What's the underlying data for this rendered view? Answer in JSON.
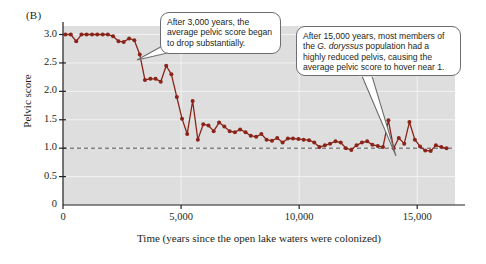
{
  "figure": {
    "panel_label": "(B)",
    "background_color": "#dededf",
    "series_color": "#8a2318",
    "reference_line_value": 1.0
  },
  "callouts": [
    {
      "id": "callout-3000-years",
      "text": "After 3,000 years, the average pelvic score began to drop substantially.",
      "lines": [
        "After 3,000 years, the",
        "average pelvic score began",
        "to drop substantially."
      ]
    },
    {
      "id": "callout-15000-years",
      "text": "After 15,000 years, most members of the G. doryssus population had a highly reduced pelvis, causing the average pelvic score to hover near 1.",
      "lines": [
        "After 15,000 years, most members of",
        "the |G. doryssus| population had a",
        "highly reduced pelvis, causing the",
        "average pelvic score to hover near 1."
      ]
    }
  ],
  "chart_data": {
    "type": "line",
    "title": "",
    "xlabel": "Time (years since the open lake waters were colonized)",
    "ylabel": "Pelvic score",
    "xlim": [
      0,
      16600
    ],
    "ylim": [
      0,
      3.15
    ],
    "xticks": [
      0,
      5000,
      10000,
      15000
    ],
    "xticklabels": [
      "0",
      "5,000",
      "10,000",
      "15,000"
    ],
    "yticks": [
      0,
      0.5,
      1.0,
      1.5,
      2.0,
      2.5,
      3.0
    ],
    "yticklabels": [
      "0",
      "0.5",
      "1.0",
      "1.5",
      "2.0",
      "2.5",
      "3.0"
    ],
    "grid": true,
    "legend": "none",
    "markers": true,
    "reference_lines": [
      {
        "y": 1.0,
        "style": "dashed"
      }
    ],
    "series": [
      {
        "name": "Average pelvic score",
        "color": "#8a2318",
        "x": [
          100,
          330,
          560,
          780,
          1000,
          1230,
          1450,
          1680,
          1900,
          2120,
          2350,
          2570,
          2800,
          3020,
          3250,
          3470,
          3700,
          3920,
          4140,
          4370,
          4590,
          4820,
          5040,
          5260,
          5490,
          5710,
          5940,
          6160,
          6380,
          6610,
          6830,
          7060,
          7280,
          7500,
          7730,
          7950,
          8180,
          8400,
          8620,
          8850,
          9070,
          9300,
          9520,
          9740,
          9970,
          10190,
          10420,
          10640,
          10860,
          11090,
          11310,
          11540,
          11760,
          11980,
          12210,
          12430,
          12660,
          12880,
          13100,
          13330,
          13550,
          13780,
          14000,
          14220,
          14450,
          14670,
          14900,
          15120,
          15340,
          15570,
          15790,
          16020,
          16240
        ],
        "y": [
          3.0,
          3.0,
          2.88,
          3.0,
          3.0,
          3.0,
          3.0,
          3.0,
          3.0,
          2.97,
          2.88,
          2.87,
          2.93,
          2.9,
          2.65,
          2.2,
          2.22,
          2.22,
          2.17,
          2.45,
          2.3,
          1.9,
          1.52,
          1.25,
          1.83,
          1.15,
          1.42,
          1.4,
          1.3,
          1.45,
          1.38,
          1.3,
          1.28,
          1.33,
          1.28,
          1.22,
          1.2,
          1.25,
          1.15,
          1.13,
          1.18,
          1.1,
          1.17,
          1.17,
          1.16,
          1.15,
          1.14,
          1.1,
          1.02,
          1.05,
          1.08,
          1.12,
          1.1,
          1.0,
          0.97,
          1.05,
          1.1,
          1.12,
          1.06,
          1.04,
          1.02,
          1.49,
          1.0,
          1.18,
          1.08,
          1.46,
          1.15,
          1.03,
          0.96,
          0.95,
          1.05,
          1.02,
          1.0
        ]
      }
    ]
  }
}
